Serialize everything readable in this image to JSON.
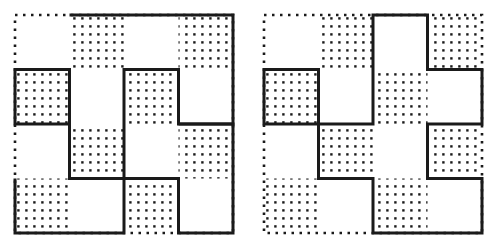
{
  "page": {
    "background_color": "#ffffff",
    "width": 498,
    "height": 248
  },
  "style": {
    "line_color": "#1a1a1a",
    "dot_color": "#1a1a1a",
    "fill_color": "#ffffff",
    "solid_stroke_width": 3,
    "dotted_stroke_width": 2.6,
    "dotted_dash_array": "2.5 5.5",
    "dot_spacing": 8,
    "dot_size": 2.4
  },
  "figures": [
    {
      "id": "figure-left",
      "name": "left-checkerboard-figure",
      "label": "",
      "grid": {
        "rows": 4,
        "cols": 4,
        "origin_x": 15,
        "origin_y": 15,
        "cell": 54.5
      },
      "shaded_cells": [
        [
          0,
          1
        ],
        [
          0,
          3
        ],
        [
          1,
          0
        ],
        [
          1,
          2
        ],
        [
          2,
          1
        ],
        [
          2,
          3
        ],
        [
          3,
          0
        ],
        [
          3,
          2
        ]
      ],
      "outline_cells": [
        [
          0,
          1
        ],
        [
          0,
          2
        ],
        [
          0,
          3
        ],
        [
          1,
          0
        ],
        [
          1,
          2
        ],
        [
          2,
          1
        ],
        [
          2,
          3
        ],
        [
          3,
          0
        ]
      ],
      "outline_path": "M 69.5 15 L 233 15 L 233 233 L 178.5 233 L 178.5 178.5 L 124 178.5 L 124 233 L 15 233 L 15 69.5 L 69.5 69.5 Z M 124 69.5 L 178.5 69.5 L 178.5 178.5 L 124 178.5 L 124 124 L 69.5 124 L 69.5 69.5 Z",
      "outline_subpaths": [
        "M 69.5 15 L 233 15 L 233 124 L 178.5 124 L 178.5 69.5 L 124 69.5 L 124 178.5 L 69.5 178.5 L 69.5 69.5 L 15 69.5 L 15 124 L 69.5 124",
        "M 178.5 124 L 233 124 L 233 233 L 178.5 233 L 178.5 178.5 L 124 178.5 L 124 233 L 15 233 L 15 178.5"
      ]
    },
    {
      "id": "figure-right",
      "name": "right-checkerboard-figure",
      "label": "",
      "grid": {
        "rows": 4,
        "cols": 4,
        "origin_x": 15,
        "origin_y": 15,
        "cell": 54.5
      },
      "shaded_cells": [
        [
          0,
          1
        ],
        [
          0,
          3
        ],
        [
          1,
          0
        ],
        [
          1,
          2
        ],
        [
          2,
          1
        ],
        [
          2,
          3
        ],
        [
          3,
          0
        ],
        [
          3,
          2
        ]
      ],
      "outline_cells": [
        [
          0,
          2
        ],
        [
          1,
          1
        ],
        [
          1,
          2
        ],
        [
          1,
          3
        ],
        [
          2,
          0
        ],
        [
          2,
          1
        ],
        [
          2,
          2
        ],
        [
          2,
          3
        ],
        [
          3,
          1
        ],
        [
          3,
          2
        ]
      ],
      "outline_path": "M 124 15 L 178.5 15 L 178.5 69.5 L 233 69.5 L 233 124 L 178.5 124 L 178.5 178.5 L 233 178.5 L 233 233 L 124 233 L 124 178.5 L 69.5 178.5 L 69.5 124 L 15 124 L 15 69.5 L 69.5 69.5 L 69.5 124 L 124 124 Z"
    }
  ]
}
